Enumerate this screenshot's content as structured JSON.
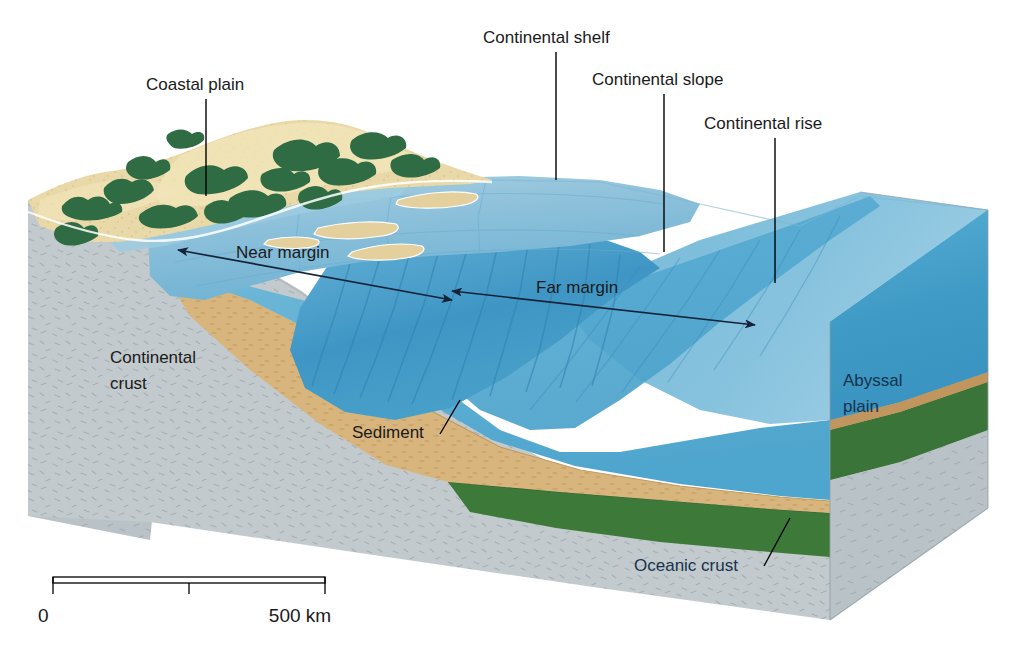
{
  "figure": {
    "type": "block-diagram",
    "background_color": "#ffffff"
  },
  "labels": {
    "coastal_plain": "Coastal plain",
    "continental_shelf": "Continental shelf",
    "continental_slope": "Continental slope",
    "continental_rise": "Continental rise",
    "near_margin": "Near margin",
    "far_margin": "Far margin",
    "continental_crust_line1": "Continental",
    "continental_crust_line2": "crust",
    "sediment": "Sediment",
    "abyssal_plain_line1": "Abyssal",
    "abyssal_plain_line2": "plain",
    "oceanic_crust": "Oceanic crust"
  },
  "scale_bar": {
    "start_label": "0",
    "end_label": "500 km",
    "total_km": 500,
    "ticks": [
      0,
      250,
      500
    ]
  },
  "colors": {
    "land_sand": "#e8d7a4",
    "land_sand_light": "#f0e3bd",
    "vegetation": "#2f6b43",
    "shelf_water": "#8cc0da",
    "shelf_water_light": "#a6cfe3",
    "deep_water": "#4fa5cd",
    "deep_water_dark": "#3d8fbe",
    "water_side_face": "#5fb0d2",
    "water_side_face_dark": "#3f99c4",
    "sediment": "#d9b57e",
    "sediment_dark": "#c9a066",
    "continental_crust": "#c3cacd",
    "continental_crust_side": "#b7c0c4",
    "oceanic_crust": "#3d7a3a",
    "oceanic_crust_dark": "#2f6330",
    "label_text": "#1a1a1a",
    "label_text_dark": "#15334d",
    "leader_line": "#000000",
    "arrow": "#15233a"
  },
  "features": [
    {
      "name": "coastal-plain",
      "kind": "land",
      "label": "Coastal plain"
    },
    {
      "name": "continental-shelf",
      "kind": "shallow-seafloor",
      "label": "Continental shelf"
    },
    {
      "name": "continental-slope",
      "kind": "steep-seafloor",
      "label": "Continental slope"
    },
    {
      "name": "continental-rise",
      "kind": "gentle-seafloor",
      "label": "Continental rise"
    },
    {
      "name": "abyssal-plain",
      "kind": "deep-seafloor",
      "label": "Abyssal plain"
    },
    {
      "name": "continental-crust",
      "kind": "crust-layer",
      "label": "Continental crust"
    },
    {
      "name": "oceanic-crust",
      "kind": "crust-layer",
      "label": "Oceanic crust"
    },
    {
      "name": "sediment",
      "kind": "sediment-wedge",
      "label": "Sediment"
    }
  ],
  "annotations": [
    {
      "name": "near-margin",
      "label": "Near margin",
      "style": "double-headed-arrow"
    },
    {
      "name": "far-margin",
      "label": "Far margin",
      "style": "double-headed-arrow"
    }
  ]
}
